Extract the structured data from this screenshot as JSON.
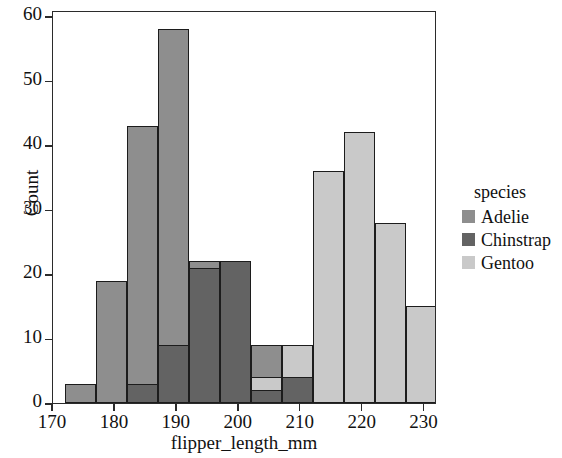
{
  "chart_data": {
    "type": "bar",
    "subtype": "histogram-overlapping",
    "title": "",
    "xlabel": "flipper_length_mm",
    "ylabel": "Count",
    "xlim": [
      170,
      232
    ],
    "ylim": [
      0,
      61
    ],
    "xticks": [
      170,
      180,
      190,
      200,
      210,
      220,
      230
    ],
    "yticks": [
      0,
      10,
      20,
      30,
      40,
      50,
      60
    ],
    "grid": false,
    "bin_width": 5,
    "legend": {
      "title": "species",
      "position": "right",
      "entries": [
        "Adelie",
        "Chinstrap",
        "Gentoo"
      ]
    },
    "colors": {
      "Adelie": "#8e8e8e",
      "Chinstrap": "#636363",
      "Gentoo": "#c9c9c9",
      "edge": "#1c1c1c",
      "frame": "#2b2b2b"
    },
    "bins": [
      [
        172,
        177
      ],
      [
        177,
        182
      ],
      [
        182,
        187
      ],
      [
        187,
        192
      ],
      [
        192,
        197
      ],
      [
        197,
        202
      ],
      [
        202,
        207
      ],
      [
        207,
        212
      ],
      [
        212,
        217
      ],
      [
        217,
        222
      ],
      [
        222,
        227
      ],
      [
        227,
        232
      ]
    ],
    "series": [
      {
        "name": "Adelie",
        "color": "#8e8e8e",
        "bins": [
          172,
          177,
          182,
          187,
          192,
          197,
          202,
          207
        ],
        "values": [
          3,
          19,
          43,
          58,
          22,
          9,
          9,
          2
        ]
      },
      {
        "name": "Chinstrap",
        "color": "#636363",
        "bins": [
          182,
          187,
          192,
          197,
          202,
          207
        ],
        "values": [
          3,
          9,
          21,
          22,
          2,
          4
        ]
      },
      {
        "name": "Gentoo",
        "color": "#c9c9c9",
        "bins": [
          207,
          212,
          217,
          222,
          227
        ],
        "values": [
          9,
          36,
          42,
          28,
          15
        ]
      }
    ],
    "bars": [
      {
        "species": "Adelie",
        "x0": 172,
        "x1": 177,
        "value": 3,
        "color": "#8e8e8e",
        "z": 1
      },
      {
        "species": "Adelie",
        "x0": 177,
        "x1": 182,
        "value": 19,
        "color": "#8e8e8e",
        "z": 1
      },
      {
        "species": "Adelie",
        "x0": 182,
        "x1": 187,
        "value": 43,
        "color": "#8e8e8e",
        "z": 1
      },
      {
        "species": "Adelie",
        "x0": 187,
        "x1": 192,
        "value": 58,
        "color": "#8e8e8e",
        "z": 1
      },
      {
        "species": "Adelie",
        "x0": 192,
        "x1": 197,
        "value": 22,
        "color": "#8e8e8e",
        "z": 1
      },
      {
        "species": "Adelie",
        "x0": 197,
        "x1": 202,
        "value": 9,
        "color": "#8e8e8e",
        "z": 1
      },
      {
        "species": "Adelie",
        "x0": 202,
        "x1": 207,
        "value": 9,
        "color": "#8e8e8e",
        "z": 1
      },
      {
        "species": "Gentoo",
        "x0": 202,
        "x1": 207,
        "value": 4,
        "color": "#c9c9c9",
        "z": 2
      },
      {
        "species": "Gentoo",
        "x0": 207,
        "x1": 212,
        "value": 9,
        "color": "#c9c9c9",
        "z": 2
      },
      {
        "species": "Gentoo",
        "x0": 212,
        "x1": 217,
        "value": 36,
        "color": "#c9c9c9",
        "z": 2
      },
      {
        "species": "Gentoo",
        "x0": 217,
        "x1": 222,
        "value": 42,
        "color": "#c9c9c9",
        "z": 2
      },
      {
        "species": "Gentoo",
        "x0": 222,
        "x1": 227,
        "value": 28,
        "color": "#c9c9c9",
        "z": 2
      },
      {
        "species": "Gentoo",
        "x0": 227,
        "x1": 232,
        "value": 15,
        "color": "#c9c9c9",
        "z": 2
      },
      {
        "species": "Chinstrap",
        "x0": 182,
        "x1": 187,
        "value": 3,
        "color": "#636363",
        "z": 3
      },
      {
        "species": "Chinstrap",
        "x0": 187,
        "x1": 192,
        "value": 9,
        "color": "#636363",
        "z": 3
      },
      {
        "species": "Chinstrap",
        "x0": 192,
        "x1": 197,
        "value": 21,
        "color": "#636363",
        "z": 3
      },
      {
        "species": "Chinstrap",
        "x0": 197,
        "x1": 202,
        "value": 22,
        "color": "#636363",
        "z": 3
      },
      {
        "species": "Chinstrap",
        "x0": 202,
        "x1": 207,
        "value": 2,
        "color": "#636363",
        "z": 3
      },
      {
        "species": "Chinstrap",
        "x0": 207,
        "x1": 212,
        "value": 4,
        "color": "#636363",
        "z": 3
      }
    ]
  }
}
